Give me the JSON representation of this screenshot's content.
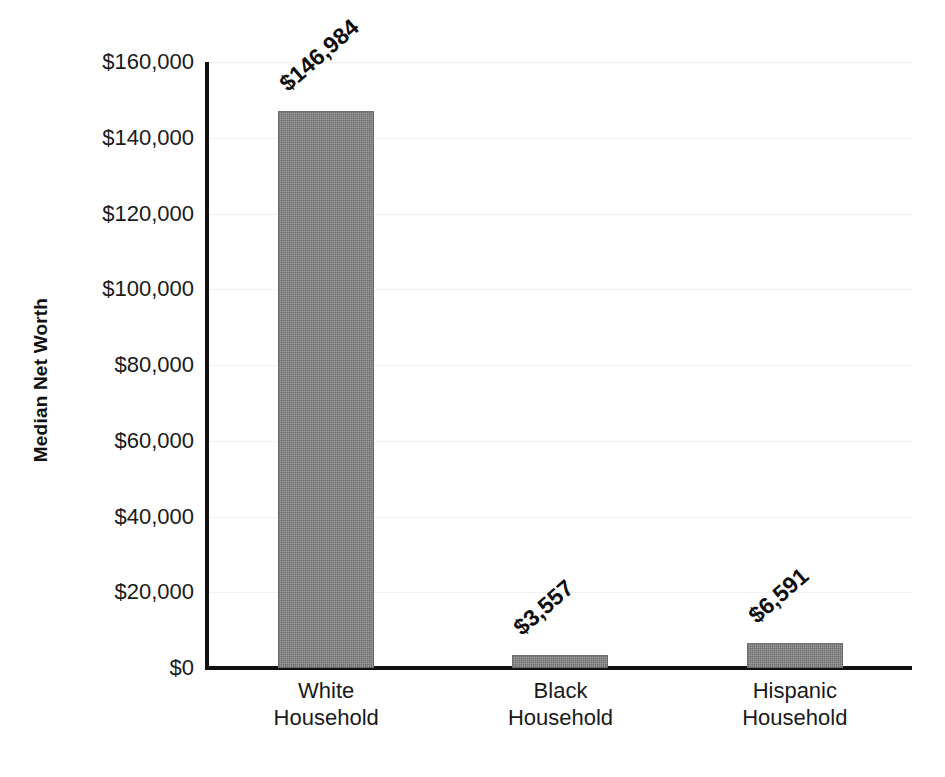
{
  "chart_data": {
    "type": "bar",
    "title": "",
    "subtitle": "",
    "xlabel": "",
    "ylabel": "Median Net Worth",
    "categories": [
      "White Household",
      "Black Household",
      "Hispanic Household"
    ],
    "category_lines": [
      [
        "White",
        "Household"
      ],
      [
        "Black",
        "Household"
      ],
      [
        "Hispanic",
        "Household"
      ]
    ],
    "values": [
      146984,
      3557,
      6591
    ],
    "value_labels": [
      "$146,984",
      "$3,557",
      "$6,591"
    ],
    "ylim": [
      0,
      160000
    ],
    "ytick_values": [
      0,
      20000,
      40000,
      60000,
      80000,
      100000,
      120000,
      140000,
      160000
    ],
    "ytick_labels": [
      "$0",
      "$20,000",
      "$40,000",
      "$60,000",
      "$80,000",
      "$100,000",
      "$120,000",
      "$140,000",
      "$160,000"
    ],
    "grid": "faint-horizontal",
    "legend": "none",
    "bar_color": "#7d7d7d",
    "axis_color": "#111111",
    "text_color": "#1a1a1a",
    "value_label_rotation_deg": -41
  }
}
